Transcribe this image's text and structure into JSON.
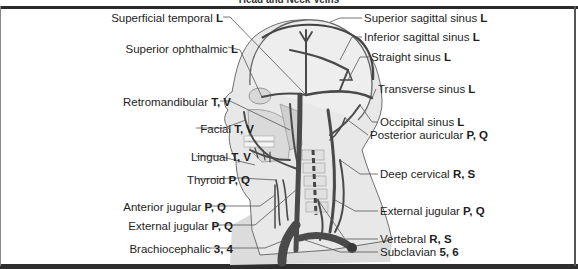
{
  "title": "Head and Neck Veins",
  "labels_left": [
    {
      "name": "Superficial temporal",
      "code": "L",
      "x": 115,
      "y": 14
    },
    {
      "name": "Superior ophthalmic",
      "code": "L",
      "x": 130,
      "y": 45
    },
    {
      "name": "Retromandibular",
      "code": "T, V",
      "x": 123,
      "y": 98
    },
    {
      "name": "Facial",
      "code": "T, V",
      "x": 146,
      "y": 125
    },
    {
      "name": "Lingual",
      "code": "T, V",
      "x": 143,
      "y": 153
    },
    {
      "name": "Thyroid",
      "code": "P, Q",
      "x": 142,
      "y": 176
    },
    {
      "name": "Anterior jugular",
      "code": "P, Q",
      "x": 118,
      "y": 203
    },
    {
      "name": "External jugular",
      "code": "P, Q",
      "x": 125,
      "y": 222
    },
    {
      "name": "Brachiocephalic",
      "code": "3, 4",
      "x": 125,
      "y": 245
    }
  ],
  "labels_right": [
    {
      "name": "Superior sagittal sinus",
      "code": "L",
      "x": 364,
      "y": 14
    },
    {
      "name": "Inferior sagittal sinus",
      "code": "L",
      "x": 364,
      "y": 33
    },
    {
      "name": "Straight sinus",
      "code": "L",
      "x": 371,
      "y": 53
    },
    {
      "name": "Transverse sinus",
      "code": "L",
      "x": 378,
      "y": 85
    },
    {
      "name": "Occipital sinus",
      "code": "L",
      "x": 380,
      "y": 118
    },
    {
      "name": "Posterior auricular",
      "code": "P, Q",
      "x": 370,
      "y": 131
    },
    {
      "name": "Deep cervical",
      "code": "R, S",
      "x": 380,
      "y": 170
    },
    {
      "name": "External jugular",
      "code": "P, Q",
      "x": 380,
      "y": 207
    },
    {
      "name": "Vertebral",
      "code": "R, S",
      "x": 380,
      "y": 235
    },
    {
      "name": "Subclavian",
      "code": "5, 6",
      "x": 380,
      "y": 248
    }
  ],
  "colors": {
    "vein": "#4a4a4a",
    "skin": "#e3e3e3",
    "bone": "#d0d0d0",
    "outline": "#777777",
    "frame": "#2b2b2b"
  }
}
